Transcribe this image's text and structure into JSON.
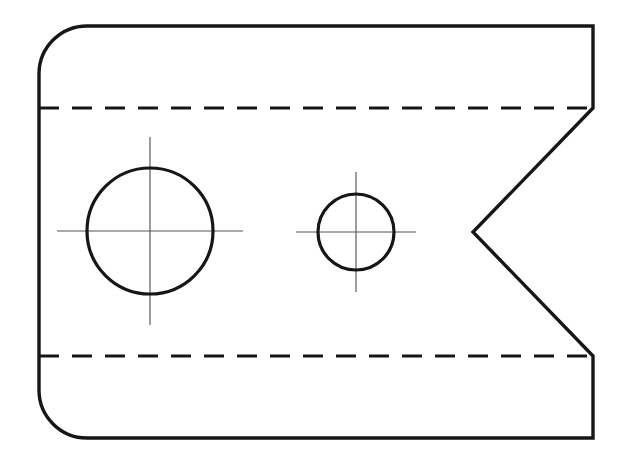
{
  "drawing": {
    "title": "Orthographic Part Outline with Two Holes and V-Notch",
    "view_label": "front-view",
    "background_color": "#ffffff",
    "line_color": "#161616",
    "center_mark_color": "#555555",
    "canvas": {
      "width": 626,
      "height": 463
    },
    "outline": {
      "name": "part-outline",
      "left_x": 39,
      "top_y": 26,
      "right_x": 593,
      "bottom_y": 438,
      "corner_radius_left": 48,
      "corner_style_right": "square",
      "stroke_width": 3.4,
      "path": "M 87 26 L 593 26 L 593 108 L 473 232 L 593 356 L 593 438 L 87 438 A 48 48 0 0 1 39 390 L 39 74 A 48 48 0 0 1 87 26 Z"
    },
    "notch": {
      "name": "v-notch",
      "apex_x": 473,
      "apex_y": 232,
      "top_x": 593,
      "top_y": 108,
      "bottom_x": 593,
      "bottom_y": 356,
      "depth": 120,
      "opening": 248
    },
    "hidden_lines": [
      {
        "name": "hidden-line-upper",
        "y": 108,
        "x_start": 39,
        "x_end": 593,
        "dash": "20 13",
        "stroke_width": 3.0
      },
      {
        "name": "hidden-line-lower",
        "y": 356,
        "x_start": 39,
        "x_end": 593,
        "dash": "20 13",
        "stroke_width": 3.0
      }
    ],
    "holes": [
      {
        "name": "large-hole",
        "cx": 150,
        "cy": 231,
        "r": 63,
        "diameter": 126,
        "stroke_width": 3.2,
        "center_mark": {
          "h_x1": 57,
          "h_x2": 243,
          "v_y1": 137,
          "v_y2": 325
        }
      },
      {
        "name": "small-hole",
        "cx": 356,
        "cy": 232,
        "r": 38,
        "diameter": 76,
        "stroke_width": 3.2,
        "center_mark": {
          "h_x1": 296,
          "h_x2": 416,
          "v_y1": 172,
          "v_y2": 292
        }
      }
    ]
  }
}
